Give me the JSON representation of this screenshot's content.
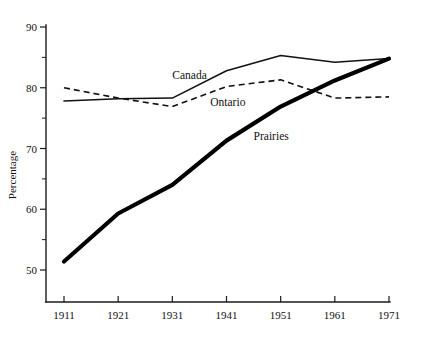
{
  "chart_data": {
    "type": "line",
    "title": "",
    "xlabel": "",
    "ylabel": "Percentage",
    "x": [
      1911,
      1921,
      1931,
      1941,
      1951,
      1961,
      1971
    ],
    "xtick_labels": [
      "1911",
      "1921",
      "1931",
      "1941",
      "1951",
      "1961",
      "1971"
    ],
    "ytick_labels": [
      "50",
      "60",
      "70",
      "80",
      "90"
    ],
    "ytick_values": [
      50,
      60,
      70,
      80,
      90
    ],
    "yminor_values": [
      55,
      65,
      75,
      85
    ],
    "xlim": [
      1911,
      1971
    ],
    "ylim": [
      45,
      90
    ],
    "grid": false,
    "legend": "inline-annotations",
    "series": [
      {
        "name": "Canada",
        "style": "solid-thin",
        "color": "#111111",
        "values": [
          77.8,
          78.2,
          78.3,
          82.8,
          85.3,
          84.2,
          84.8
        ],
        "label_x": 1931,
        "label_y": 81.5
      },
      {
        "name": "Ontario",
        "style": "dashed",
        "color": "#111111",
        "values": [
          80.0,
          78.3,
          76.9,
          80.2,
          81.3,
          78.3,
          78.5
        ],
        "label_x": 1938,
        "label_y": 77.0
      },
      {
        "name": "Prairies",
        "style": "solid-thick",
        "color": "#000000",
        "values": [
          51.4,
          59.3,
          64.0,
          71.3,
          76.9,
          81.2,
          84.8
        ],
        "label_x": 1946,
        "label_y": 71.4
      }
    ],
    "annotations": [
      {
        "text": "Canada",
        "x": 1931,
        "y": 81.5
      },
      {
        "text": "Ontario",
        "x": 1938,
        "y": 77.0
      },
      {
        "text": "Prairies",
        "x": 1946,
        "y": 71.4
      }
    ]
  }
}
